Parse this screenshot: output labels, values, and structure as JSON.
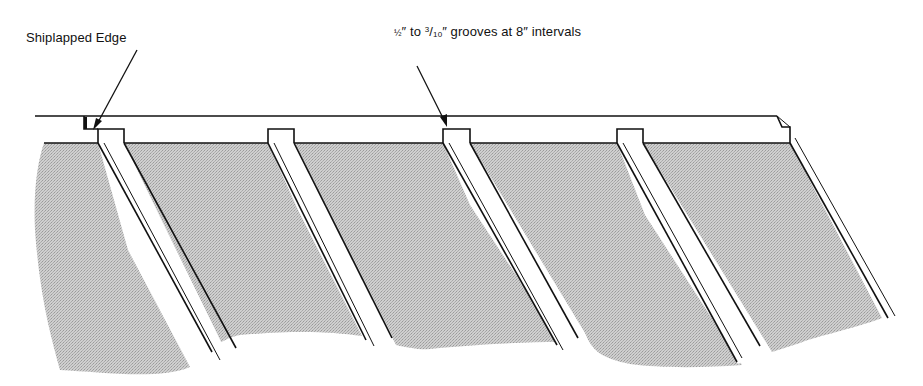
{
  "diagram": {
    "labels": {
      "shiplapped_edge": "Shiplapped Edge",
      "grooves_part1_whole": "½",
      "grooves_part2": "to",
      "grooves_frac_num": "3",
      "grooves_frac_den": "10",
      "grooves_part3": "grooves at 8",
      "grooves_part4": "intervals",
      "inch_mark": "″"
    },
    "full_grooves_text": "½″ to 3/10″ grooves at 8″ intervals",
    "groove_count": 5,
    "groove_spacing": "8 in",
    "groove_width_range": "1/2 in to 3/10 in",
    "colors": {
      "line": "#111111",
      "panel_fill": "#bdbdbd",
      "background": "#ffffff"
    }
  }
}
